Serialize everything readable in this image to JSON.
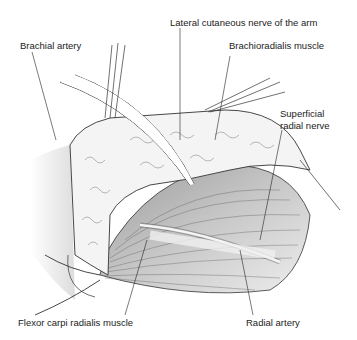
{
  "figure": {
    "type": "surgical anatomy illustration",
    "labels": {
      "lateral_cutaneous": "Lateral cutaneous nerve of the arm",
      "brachial_artery": "Brachial artery",
      "brachioradialis": "Brachioradialis muscle",
      "superficial_radial_1": "Superficial",
      "superficial_radial_2": "radial nerve",
      "flexor_carpi": "Flexor carpi radialis muscle",
      "radial_artery": "Radial artery"
    },
    "colors": {
      "line": "#222222",
      "muscle_shade": "#b8b8b8",
      "fat": "#f2f2f2",
      "shadow": "#d9d9d9"
    }
  }
}
